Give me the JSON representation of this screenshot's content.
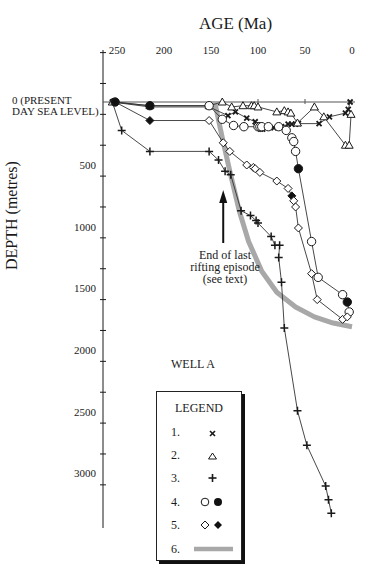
{
  "chart_data": {
    "type": "line",
    "title": "AGE (Ma)",
    "xlabel": "AGE (Ma)",
    "ylabel": "DEPTH (metres)",
    "x_ticks": [
      250,
      200,
      150,
      100,
      50,
      0
    ],
    "y_ticks": [
      500,
      1000,
      1500,
      2000,
      2500,
      3000
    ],
    "y_zero_label": "0 (PRESENT DAY SEA LEVEL)",
    "xlim": [
      262,
      -5
    ],
    "ylim": [
      -480,
      3400
    ],
    "y_inverted": true,
    "annotations": [
      {
        "text": "End of last rifting episode (see text)",
        "arrow_at_age": 137
      },
      {
        "text": "WELL A"
      }
    ],
    "legend_title": "LEGEND",
    "series": [
      {
        "name": "1.",
        "marker": "x",
        "points": [
          [
            255,
            0
          ],
          [
            215,
            -40
          ],
          [
            152,
            -40
          ],
          [
            132,
            -110
          ],
          [
            124,
            -80
          ],
          [
            112,
            -130
          ],
          [
            103,
            -160
          ],
          [
            97,
            -220
          ],
          [
            95,
            -220
          ],
          [
            83,
            -210
          ],
          [
            75,
            -200
          ],
          [
            68,
            -180
          ],
          [
            64,
            -180
          ],
          [
            60,
            -180
          ],
          [
            57,
            -175
          ],
          [
            35,
            -175
          ],
          [
            24,
            -120
          ],
          [
            7,
            -90
          ],
          [
            4,
            -60
          ],
          [
            2,
            0
          ]
        ]
      },
      {
        "name": "2.",
        "marker": "triangle-open",
        "points": [
          [
            255,
            0
          ],
          [
            215,
            -30
          ],
          [
            152,
            -30
          ],
          [
            138,
            0
          ],
          [
            128,
            -40
          ],
          [
            116,
            -30
          ],
          [
            107,
            -30
          ],
          [
            104,
            -30
          ],
          [
            100,
            -40
          ],
          [
            80,
            -80
          ],
          [
            72,
            -70
          ],
          [
            68,
            -80
          ],
          [
            65,
            -90
          ],
          [
            58,
            -170
          ],
          [
            40,
            -40
          ],
          [
            30,
            -120
          ],
          [
            7,
            -350
          ],
          [
            3,
            -350
          ],
          [
            1,
            -100
          ]
        ]
      },
      {
        "name": "3.",
        "marker": "plus",
        "points": [
          [
            255,
            0
          ],
          [
            245,
            -230
          ],
          [
            215,
            -400
          ],
          [
            152,
            -400
          ],
          [
            142,
            -470
          ],
          [
            135,
            -560
          ],
          [
            129,
            -590
          ],
          [
            118,
            -880
          ],
          [
            108,
            -920
          ],
          [
            102,
            -960
          ],
          [
            100,
            -980
          ],
          [
            86,
            -1090
          ],
          [
            82,
            -1160
          ],
          [
            77,
            -1160
          ],
          [
            78,
            -1260
          ],
          [
            75,
            -1460
          ],
          [
            72,
            -1830
          ],
          [
            58,
            -2500
          ],
          [
            48,
            -2780
          ],
          [
            28,
            -3110
          ],
          [
            25,
            -3220
          ],
          [
            22,
            -3330
          ]
        ]
      },
      {
        "name": "4.",
        "marker": "circle",
        "filled_points_age": [
          252,
          215,
          57,
          5
        ],
        "points": [
          [
            252,
            0
          ],
          [
            215,
            -30
          ],
          [
            152,
            -30
          ],
          [
            138,
            -140
          ],
          [
            126,
            -190
          ],
          [
            115,
            -200
          ],
          [
            100,
            -200
          ],
          [
            98,
            -200
          ],
          [
            96,
            -200
          ],
          [
            89,
            -200
          ],
          [
            78,
            -200
          ],
          [
            70,
            -230
          ],
          [
            64,
            -290
          ],
          [
            62,
            -320
          ],
          [
            60,
            -400
          ],
          [
            57,
            -540
          ],
          [
            43,
            -1130
          ],
          [
            36,
            -1420
          ],
          [
            10,
            -1560
          ],
          [
            5,
            -1620
          ],
          [
            3,
            -1700
          ]
        ]
      },
      {
        "name": "5.",
        "marker": "diamond",
        "filled_points_age": [
          252,
          215,
          64
        ],
        "points": [
          [
            252,
            0
          ],
          [
            215,
            -150
          ],
          [
            152,
            -150
          ],
          [
            137,
            -330
          ],
          [
            130,
            -400
          ],
          [
            112,
            -510
          ],
          [
            105,
            -530
          ],
          [
            103,
            -540
          ],
          [
            98,
            -570
          ],
          [
            80,
            -640
          ],
          [
            68,
            -700
          ],
          [
            64,
            -760
          ],
          [
            62,
            -800
          ],
          [
            60,
            -850
          ],
          [
            57,
            -1020
          ],
          [
            43,
            -1390
          ],
          [
            37,
            -1600
          ],
          [
            10,
            -1760
          ],
          [
            5,
            -1740
          ]
        ]
      },
      {
        "name": "6.",
        "marker": "thick-gray-curve",
        "points": [
          [
            146,
            0
          ],
          [
            138,
            -290
          ],
          [
            130,
            -560
          ],
          [
            120,
            -880
          ],
          [
            110,
            -1130
          ],
          [
            96,
            -1370
          ],
          [
            80,
            -1540
          ],
          [
            60,
            -1660
          ],
          [
            40,
            -1740
          ],
          [
            20,
            -1790
          ],
          [
            0,
            -1820
          ]
        ]
      }
    ]
  },
  "labels": {
    "title": "AGE (Ma)",
    "ylabel": "DEPTH (metres)",
    "xticks": [
      "250",
      "200",
      "150",
      "100",
      "50",
      "0"
    ],
    "yticks": [
      "500",
      "1000",
      "1500",
      "2000",
      "2500",
      "3000"
    ],
    "zero_line1": "0 (PRESENT",
    "zero_line2": "DAY SEA LEVEL)",
    "annot_line1": "End of last",
    "annot_line2": "rifting episode",
    "annot_line3": "(see text)",
    "well": "WELL A"
  },
  "legend": {
    "title": "LEGEND",
    "items": [
      "1.",
      "2.",
      "3.",
      "4.",
      "5.",
      "6."
    ]
  },
  "colors": {
    "ink": "#1a1a1a",
    "curve6": "#a8a8a8"
  }
}
